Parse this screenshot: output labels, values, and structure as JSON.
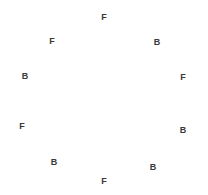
{
  "canvas": {
    "width": 208,
    "height": 195,
    "background_color": "#ffffff"
  },
  "chart_data": {
    "type": "scatter",
    "title": "",
    "subtitle": "",
    "xlabel": "",
    "ylabel": "",
    "xlim": [
      0,
      208
    ],
    "ylim": [
      0,
      195
    ],
    "grid": false,
    "legend": null,
    "axes_visible": false,
    "tick_labels": [],
    "marker_style": {
      "kind": "text-label",
      "color": "#3a3a3a",
      "font_size_px": 9,
      "font_weight": "bold"
    },
    "circle": {
      "center_x": 104,
      "center_y": 97,
      "radius": 84,
      "point_count": 10,
      "angle_step_degrees": 36
    },
    "categories": [
      "F",
      "B"
    ],
    "counts": {
      "F": 5,
      "B": 5
    },
    "sequence_clockwise_from_top": [
      "F",
      "B",
      "F",
      "B",
      "B",
      "F",
      "B",
      "F",
      "B",
      "F"
    ],
    "points": [
      {
        "id": "p1",
        "label": "F",
        "x": 104,
        "y": 17,
        "angle_deg": 90,
        "position": "top"
      },
      {
        "id": "p2",
        "label": "B",
        "x": 157,
        "y": 42,
        "angle_deg": 54,
        "position": "upper-right"
      },
      {
        "id": "p3",
        "label": "F",
        "x": 183,
        "y": 77,
        "angle_deg": 18,
        "position": "right-upper"
      },
      {
        "id": "p4",
        "label": "B",
        "x": 183,
        "y": 130,
        "angle_deg": -18,
        "position": "right-lower"
      },
      {
        "id": "p5",
        "label": "B",
        "x": 153,
        "y": 167,
        "angle_deg": -54,
        "position": "lower-right"
      },
      {
        "id": "p6",
        "label": "F",
        "x": 104,
        "y": 181,
        "angle_deg": -90,
        "position": "bottom"
      },
      {
        "id": "p7",
        "label": "B",
        "x": 54,
        "y": 162,
        "angle_deg": -126,
        "position": "lower-left"
      },
      {
        "id": "p8",
        "label": "F",
        "x": 22,
        "y": 126,
        "angle_deg": -162,
        "position": "left-lower"
      },
      {
        "id": "p9",
        "label": "B",
        "x": 25,
        "y": 76,
        "angle_deg": 162,
        "position": "left-upper"
      },
      {
        "id": "p10",
        "label": "F",
        "x": 52,
        "y": 41,
        "angle_deg": 126,
        "position": "upper-left"
      }
    ]
  }
}
